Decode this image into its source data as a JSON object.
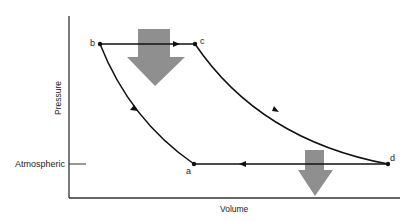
{
  "diagram": {
    "type": "pv-cycle",
    "axes": {
      "x_label": "Volume",
      "y_label": "Pressure"
    },
    "reference_line": {
      "label": "Atmospheric"
    },
    "points": [
      {
        "id": "a",
        "label": "a"
      },
      {
        "id": "b",
        "label": "b"
      },
      {
        "id": "c",
        "label": "c"
      },
      {
        "id": "d",
        "label": "d"
      }
    ],
    "paths": [
      {
        "from": "a",
        "to": "b",
        "shape": "curve"
      },
      {
        "from": "b",
        "to": "c",
        "shape": "straight"
      },
      {
        "from": "c",
        "to": "d",
        "shape": "curve"
      },
      {
        "from": "d",
        "to": "a",
        "shape": "straight"
      }
    ],
    "heat_arrows": [
      {
        "location": "b-c",
        "direction": "down",
        "size": "large"
      },
      {
        "location": "d-a",
        "direction": "down",
        "size": "small"
      }
    ],
    "colors": {
      "line": "#111111",
      "heat_arrow": "#8f8f8f",
      "axis": "#333333"
    }
  }
}
